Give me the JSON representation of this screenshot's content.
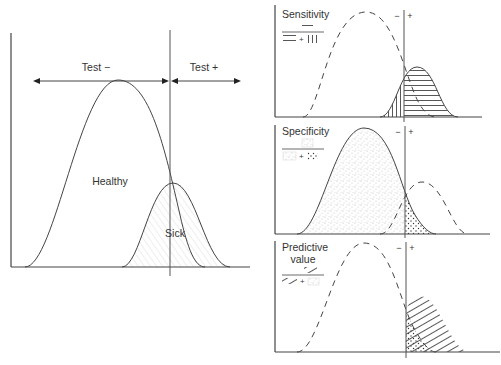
{
  "main_figure": {
    "test_negative_label": "Test −",
    "test_positive_label": "Test +",
    "healthy_label": "Healthy",
    "sick_label": "Sick"
  },
  "panels": [
    {
      "title": "Sensitivity",
      "title_line2": "",
      "numerator": "true positives (horizontal hatching)",
      "denominator": "true positives + false negatives (vertical hatching)",
      "plus": "+",
      "minus_mark": "−",
      "plus_mark": "+"
    },
    {
      "title": "Specificity",
      "title_line2": "",
      "numerator": "true negatives (light stipple)",
      "denominator": "true negatives + false positives (dense stipple)",
      "plus": "+",
      "minus_mark": "−",
      "plus_mark": "+"
    },
    {
      "title": "Predictive",
      "title_line2": "value",
      "numerator": "true positives (diagonal hatching)",
      "denominator": "true positives + false positives (stipple)",
      "plus": "+",
      "minus_mark": "−",
      "plus_mark": "+"
    }
  ],
  "colors": {
    "line": "#444444",
    "text": "#333333",
    "background": "#ffffff"
  }
}
